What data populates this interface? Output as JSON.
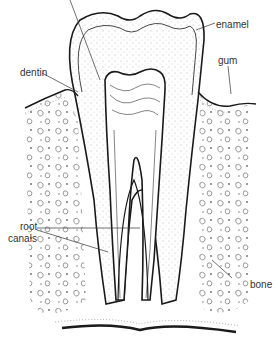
{
  "diagram": {
    "labels": {
      "enamel": "enamel",
      "gum": "gum",
      "dentin": "dentin",
      "root_canals_line1": "root",
      "root_canals_line2": "canals",
      "bone": "bone"
    },
    "colors": {
      "line": "#1a1a1a",
      "text": "#333333",
      "background": "#ffffff"
    }
  }
}
